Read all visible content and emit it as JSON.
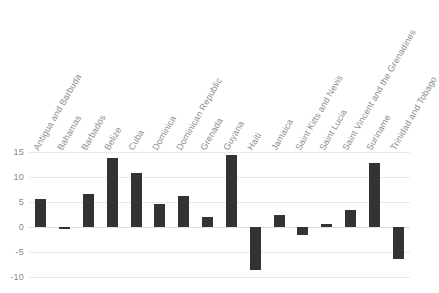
{
  "chart_data": {
    "type": "bar",
    "title": "",
    "subtitle": "",
    "xlabel": "",
    "ylabel": "",
    "ylim": [
      -10,
      15
    ],
    "yticks": [
      15,
      10,
      5,
      0,
      -5,
      -10
    ],
    "grid": true,
    "legend": null,
    "bar_color": "#333333",
    "gridline_color": "#e9e9e9",
    "tick_label_color": "#8a8a8a",
    "category_label_rotation": -60,
    "categories": [
      "Antigua and Barbuda",
      "Bahamas",
      "Barbados",
      "Belize",
      "Cuba",
      "Dominica",
      "Dominican Republic",
      "Grenada",
      "Guyana",
      "Haiti",
      "Jamaica",
      "Saint Kitts and Nevis",
      "Saint Lucia",
      "Saint Vincent and the Grenadines",
      "Suriname",
      "Trinidad and Tobago"
    ],
    "values": [
      5.6,
      -0.4,
      6.6,
      13.8,
      10.8,
      4.7,
      6.2,
      2.1,
      14.5,
      -8.6,
      2.5,
      -1.6,
      0.7,
      3.5,
      12.8,
      -6.4
    ]
  }
}
